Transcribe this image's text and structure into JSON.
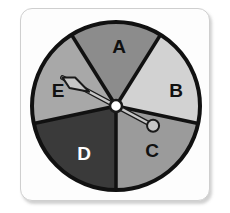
{
  "figure": {
    "kind": "probability-spinner",
    "background_color": "#ffffff",
    "card": {
      "background_color": "#fdfdfd",
      "border_color": "#cfcfcf",
      "shadow_color": "#787878"
    },
    "wheel": {
      "center_x": 116,
      "center_y": 106,
      "radius": 84,
      "outline_color": "#111111",
      "outline_width": 4
    },
    "pointer": {
      "name": "spinner-needle",
      "body_color": "#c6c6c6",
      "outline_color": "#1a1a1a",
      "tip_angle_deg": 208,
      "tail_angle_deg": 28,
      "tip_points_to": "E",
      "tail_points_to": "C",
      "hub": {
        "fill_color": "#ffffff",
        "outline_color": "#1a1a1a",
        "radius": 6
      }
    },
    "sectors": [
      {
        "label": "A",
        "fill_color": "#8c8c8c",
        "text_color": "#111111",
        "start_angle_deg": -122,
        "end_angle_deg": -58,
        "label_x": 119,
        "label_y": 48
      },
      {
        "label": "B",
        "fill_color": "#d2d2d2",
        "text_color": "#111111",
        "start_angle_deg": -58,
        "end_angle_deg": 12,
        "label_x": 176,
        "label_y": 92
      },
      {
        "label": "C",
        "fill_color": "#9b9b9b",
        "text_color": "#111111",
        "start_angle_deg": 12,
        "end_angle_deg": 90,
        "label_x": 152,
        "label_y": 152
      },
      {
        "label": "D",
        "fill_color": "#3a3a3a",
        "text_color": "#ffffff",
        "start_angle_deg": 90,
        "end_angle_deg": 168,
        "label_x": 84,
        "label_y": 155
      },
      {
        "label": "E",
        "fill_color": "#a8a8a8",
        "text_color": "#111111",
        "start_angle_deg": 168,
        "end_angle_deg": 238,
        "label_x": 58,
        "label_y": 92
      }
    ]
  }
}
